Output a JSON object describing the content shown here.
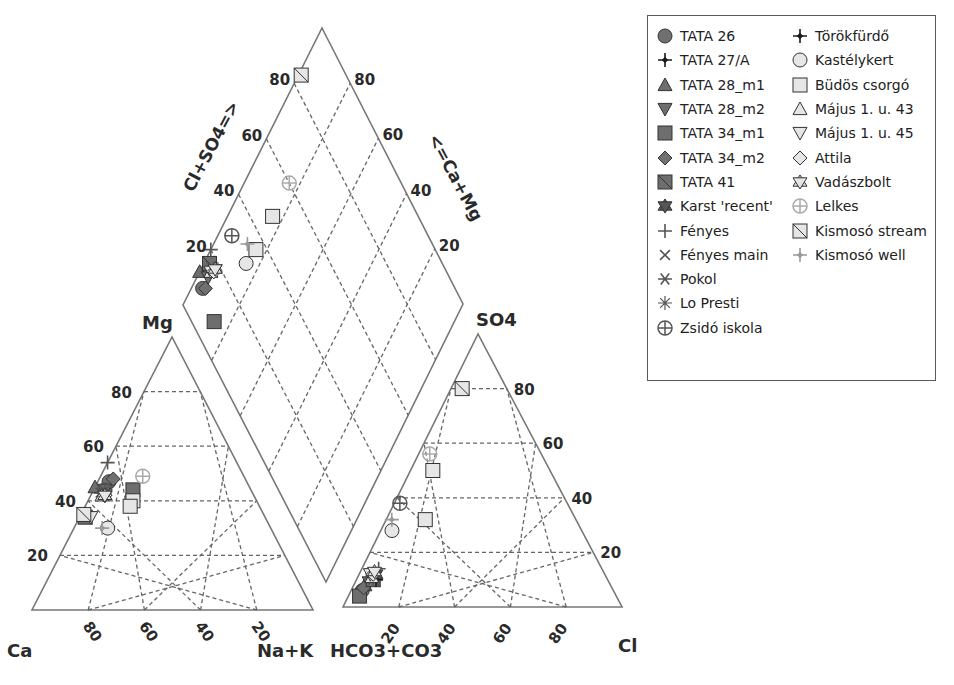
{
  "chart_data": {
    "type": "scatter",
    "subtype": "piper-diagram",
    "title": "",
    "cation_triangle": {
      "apex_label": "Mg",
      "left_label": "Ca",
      "right_label": "Na+K",
      "left_ticks": [
        "20",
        "40",
        "60",
        "80"
      ],
      "bottom_ticks": [
        "80",
        "60",
        "40",
        "20"
      ]
    },
    "anion_triangle": {
      "apex_label": "SO4",
      "left_label": "HCO3+CO3",
      "right_label": "Cl",
      "right_ticks": [
        "20",
        "40",
        "60",
        "80"
      ],
      "bottom_ticks": [
        "20",
        "40",
        "60",
        "80"
      ]
    },
    "diamond": {
      "left_axis_label": "Cl+SO4=>",
      "right_axis_label": "<=Ca+Mg",
      "left_ticks": [
        "20",
        "40",
        "60",
        "80"
      ],
      "right_ticks": [
        "20",
        "40",
        "60",
        "80"
      ]
    },
    "grid": true,
    "legend_position": "upper-right",
    "series": [
      {
        "name": "TATA 26",
        "marker": "circle",
        "color": "#707070",
        "cation": {
          "Ca": 49,
          "Mg": 47,
          "NaK": 4
        },
        "anion": {
          "SO4": 6,
          "Cl": 4,
          "HCO3": 90
        },
        "diamond": {
          "ClSO4": 10,
          "CaMg": 96
        }
      },
      {
        "name": "TATA 27/A",
        "marker": "plus-diamond",
        "color": "#1a1a1a",
        "cation": {
          "Ca": 54,
          "Mg": 43,
          "NaK": 3
        },
        "anion": {
          "SO4": 10,
          "Cl": 7,
          "HCO3": 83
        },
        "diamond": {
          "ClSO4": 17,
          "CaMg": 97
        }
      },
      {
        "name": "TATA 28_m1",
        "marker": "triangle-up",
        "color": "#6e6e6e",
        "cation": {
          "Ca": 55,
          "Mg": 45,
          "NaK": 0
        },
        "anion": {
          "SO4": 8,
          "Cl": 4,
          "HCO3": 88
        },
        "diamond": {
          "ClSO4": 12,
          "CaMg": 100
        }
      },
      {
        "name": "TATA 28_m2",
        "marker": "triangle-down",
        "color": "#6e6e6e",
        "cation": {
          "Ca": 52,
          "Mg": 44,
          "NaK": 4
        },
        "anion": {
          "SO4": 9,
          "Cl": 5,
          "HCO3": 86
        },
        "diamond": {
          "ClSO4": 14,
          "CaMg": 96
        }
      },
      {
        "name": "TATA 34_m1",
        "marker": "square",
        "color": "#6e6e6e",
        "cation": {
          "Ca": 42,
          "Mg": 44,
          "NaK": 14
        },
        "anion": {
          "SO4": 4,
          "Cl": 4,
          "HCO3": 92
        },
        "diamond": {
          "ClSO4": 8,
          "CaMg": 86
        }
      },
      {
        "name": "TATA 34_m2",
        "marker": "diamond",
        "color": "#707070",
        "cation": {
          "Ca": 47,
          "Mg": 48,
          "NaK": 5
        },
        "anion": {
          "SO4": 7,
          "Cl": 4,
          "HCO3": 89
        },
        "diamond": {
          "ClSO4": 11,
          "CaMg": 95
        }
      },
      {
        "name": "TATA 41",
        "marker": "square-slash",
        "color": "#6e6e6e",
        "cation": {
          "Ca": 64,
          "Mg": 34,
          "NaK": 2
        },
        "anion": {
          "SO4": 10,
          "Cl": 6,
          "HCO3": 84
        },
        "diamond": {
          "ClSO4": 17,
          "CaMg": 98
        }
      },
      {
        "name": "Karst 'recent'",
        "marker": "star-of-david",
        "color": "#555555",
        "cation": {
          "Ca": 53,
          "Mg": 42,
          "NaK": 5
        },
        "anion": {
          "SO4": 12,
          "Cl": 6,
          "HCO3": 82
        },
        "diamond": {
          "ClSO4": 18,
          "CaMg": 95
        }
      },
      {
        "name": "Fényes",
        "marker": "plus",
        "color": "#555555",
        "cation": {
          "Ca": 46,
          "Mg": 54,
          "NaK": 0
        },
        "anion": {
          "SO4": 14,
          "Cl": 6,
          "HCO3": 80
        },
        "diamond": {
          "ClSO4": 20,
          "CaMg": 100
        }
      },
      {
        "name": "Fényes main",
        "marker": "x",
        "color": "#555555",
        "cation": {
          "Ca": 54,
          "Mg": 43,
          "NaK": 3
        },
        "anion": {
          "SO4": 11,
          "Cl": 6,
          "HCO3": 83
        },
        "diamond": {
          "ClSO4": 17,
          "CaMg": 97
        }
      },
      {
        "name": "Pokol",
        "marker": "asterisk",
        "color": "#555555",
        "cation": {
          "Ca": 53,
          "Mg": 43,
          "NaK": 4
        },
        "anion": {
          "SO4": 11,
          "Cl": 5,
          "HCO3": 84
        },
        "diamond": {
          "ClSO4": 16,
          "CaMg": 96
        }
      },
      {
        "name": "Lo Presti",
        "marker": "starburst",
        "color": "#555555",
        "cation": {
          "Ca": 52,
          "Mg": 44,
          "NaK": 4
        },
        "anion": {
          "SO4": 10,
          "Cl": 6,
          "HCO3": 84
        },
        "diamond": {
          "ClSO4": 16,
          "CaMg": 96
        }
      },
      {
        "name": "Zsidó iskola",
        "marker": "circle-cross",
        "color": "#555555",
        "cation": {
          "Ca": 52,
          "Mg": 44,
          "NaK": 4
        },
        "anion": {
          "SO4": 38,
          "Cl": 2,
          "HCO3": 60
        },
        "diamond": {
          "ClSO4": 30,
          "CaMg": 95
        }
      },
      {
        "name": "Törökfürdő",
        "marker": "plus-diamond",
        "color": "#1a1a1a",
        "cation": {
          "Ca": 53,
          "Mg": 42,
          "NaK": 5
        },
        "anion": {
          "SO4": 10,
          "Cl": 7,
          "HCO3": 83
        },
        "diamond": {
          "ClSO4": 17,
          "CaMg": 95
        }
      },
      {
        "name": "Kastélykert",
        "marker": "circle",
        "color": "#e6e6e6",
        "cation": {
          "Ca": 58,
          "Mg": 30,
          "NaK": 12
        },
        "anion": {
          "SO4": 28,
          "Cl": 4,
          "HCO3": 68
        },
        "diamond": {
          "ClSO4": 30,
          "CaMg": 85
        }
      },
      {
        "name": "Büdös csorgó",
        "marker": "square",
        "color": "#e6e6e6",
        "cation": {
          "Ca": 44,
          "Mg": 40,
          "NaK": 16
        },
        "anion": {
          "SO4": 50,
          "Cl": 8,
          "HCO3": 42
        },
        "diamond": {
          "ClSO4": 48,
          "CaMg": 84
        },
        "extra": [
          {
            "cation": {
              "Ca": 46,
              "Mg": 38,
              "NaK": 16
            },
            "anion": {
              "SO4": 32,
              "Cl": 14,
              "HCO3": 54
            },
            "diamond": {
              "ClSO4": 36,
              "CaMg": 84
            }
          }
        ]
      },
      {
        "name": "Május 1. u. 43",
        "marker": "triangle-up",
        "color": "#e6e6e6",
        "cation": {
          "Ca": 54,
          "Mg": 42,
          "NaK": 4
        },
        "anion": {
          "SO4": 11,
          "Cl": 5,
          "HCO3": 84
        },
        "diamond": {
          "ClSO4": 16,
          "CaMg": 96
        }
      },
      {
        "name": "Május 1. u. 45",
        "marker": "triangle-down",
        "color": "#e6e6e6",
        "cation": {
          "Ca": 62,
          "Mg": 34,
          "NaK": 4
        },
        "anion": {
          "SO4": 12,
          "Cl": 4,
          "HCO3": 84
        },
        "diamond": {
          "ClSO4": 16,
          "CaMg": 96
        }
      },
      {
        "name": "Attila",
        "marker": "diamond",
        "color": "#e6e6e6",
        "cation": {
          "Ca": 53,
          "Mg": 42,
          "NaK": 5
        },
        "anion": {
          "SO4": 12,
          "Cl": 5,
          "HCO3": 83
        },
        "diamond": {
          "ClSO4": 17,
          "CaMg": 95
        }
      },
      {
        "name": "Vadászbolt",
        "marker": "star-of-david",
        "color": "#e6e6e6",
        "cation": {
          "Ca": 53,
          "Mg": 42,
          "NaK": 5
        },
        "anion": {
          "SO4": 13,
          "Cl": 5,
          "HCO3": 82
        },
        "diamond": {
          "ClSO4": 18,
          "CaMg": 95
        }
      },
      {
        "name": "Lelkes",
        "marker": "circle-cross",
        "color": "#aaaaaa",
        "cation": {
          "Ca": 36,
          "Mg": 49,
          "NaK": 15
        },
        "anion": {
          "SO4": 56,
          "Cl": 4,
          "HCO3": 40
        },
        "diamond": {
          "ClSO4": 60,
          "CaMg": 84
        }
      },
      {
        "name": "Kismosó stream",
        "marker": "square-slash",
        "color": "#e6e6e6",
        "cation": {
          "Ca": 64,
          "Mg": 35,
          "NaK": 1
        },
        "anion": {
          "SO4": 80,
          "Cl": 4,
          "HCO3": 16
        },
        "diamond": {
          "ClSO4": 84,
          "CaMg": 99
        }
      },
      {
        "name": "Kismosó well",
        "marker": "plus-diamond",
        "color": "#9a9a9a",
        "cation": {
          "Ca": 60,
          "Mg": 30,
          "NaK": 10
        },
        "anion": {
          "SO4": 32,
          "Cl": 2,
          "HCO3": 66
        },
        "diamond": {
          "ClSO4": 34,
          "CaMg": 88
        }
      }
    ]
  },
  "legend": {
    "col1": [
      "TATA 26",
      "TATA 27/A",
      "TATA 28_m1",
      "TATA 28_m2",
      "TATA 34_m1",
      "TATA 34_m2",
      "TATA 41",
      "Karst 'recent'",
      "Fényes",
      "Fényes main",
      "Pokol",
      "Lo Presti",
      "Zsidó iskola"
    ],
    "col2": [
      "Törökfürdő",
      "Kastélykert",
      "Büdös csorgó",
      "Május 1. u. 43",
      "Május 1. u. 45",
      "Attila",
      "Vadászbolt",
      "Lelkes",
      "Kismosó stream",
      "Kismosó well"
    ]
  }
}
